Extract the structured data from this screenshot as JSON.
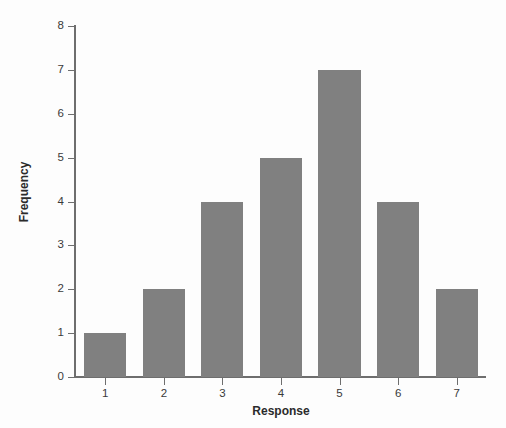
{
  "chart_data": {
    "type": "bar",
    "title": "",
    "xlabel": "Response",
    "ylabel": "Frequency",
    "categories": [
      "1",
      "2",
      "3",
      "4",
      "5",
      "6",
      "7"
    ],
    "values": [
      1,
      2,
      4,
      5,
      7,
      4,
      2
    ],
    "ylim": [
      0,
      8
    ],
    "y_ticks": [
      "0",
      "1",
      "2",
      "3",
      "4",
      "5",
      "6",
      "7",
      "8"
    ],
    "x_ticks": [
      "1",
      "2",
      "3",
      "4",
      "5",
      "6",
      "7"
    ],
    "grid": false,
    "legend": false,
    "legend_position": "none",
    "bar_color": "#808080",
    "axis_color": "#6e6e6e",
    "text_color": "#3a3a3a",
    "background_color": "#fdfdfd"
  }
}
